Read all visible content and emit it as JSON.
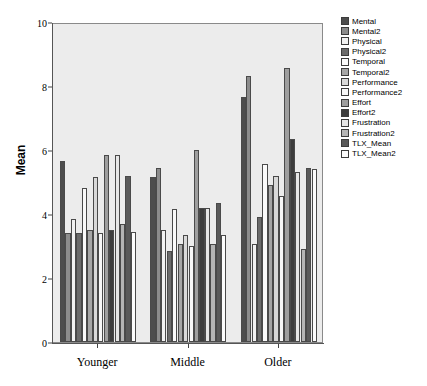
{
  "chart_data": {
    "type": "bar",
    "title": "",
    "xlabel": "",
    "ylabel": "Mean",
    "ylim": [
      0,
      10
    ],
    "yticks": [
      0,
      2,
      4,
      6,
      8,
      10
    ],
    "grid": false,
    "legend_position": "right",
    "categories": [
      "Younger",
      "Middle",
      "Older"
    ],
    "series": [
      {
        "name": "Mental",
        "color": "#4d4d4d",
        "values": [
          5.65,
          5.15,
          7.65
        ]
      },
      {
        "name": "Mental2",
        "color": "#8c8c8c",
        "values": [
          3.4,
          5.45,
          8.3
        ]
      },
      {
        "name": "Physical",
        "color": "#f2f2f2",
        "values": [
          3.85,
          3.5,
          3.05
        ]
      },
      {
        "name": "Physical2",
        "color": "#6b6b6b",
        "values": [
          3.4,
          2.85,
          3.9
        ]
      },
      {
        "name": "Temporal",
        "color": "#fafafa",
        "values": [
          4.8,
          4.15,
          5.55
        ]
      },
      {
        "name": "Temporal2",
        "color": "#a6a6a6",
        "values": [
          3.5,
          3.05,
          4.9
        ]
      },
      {
        "name": "Performance",
        "color": "#d9d9d9",
        "values": [
          5.15,
          3.35,
          5.2
        ]
      },
      {
        "name": "Performance2",
        "color": "#f7f7f7",
        "values": [
          3.4,
          3.0,
          4.55
        ]
      },
      {
        "name": "Effort",
        "color": "#9e9e9e",
        "values": [
          5.85,
          6.0,
          8.55
        ]
      },
      {
        "name": "Effort2",
        "color": "#3d3d3d",
        "values": [
          3.5,
          4.2,
          6.35
        ]
      },
      {
        "name": "Frustration",
        "color": "#e6e6e6",
        "values": [
          5.85,
          4.2,
          5.3
        ]
      },
      {
        "name": "Frustration2",
        "color": "#b5b5b5",
        "values": [
          3.7,
          3.05,
          2.9
        ]
      },
      {
        "name": "TLX_Mean",
        "color": "#5a5a5a",
        "values": [
          5.2,
          4.35,
          5.45
        ]
      },
      {
        "name": "TLX_Mean2",
        "color": "#fcfcfc",
        "values": [
          3.45,
          3.35,
          5.4
        ]
      }
    ]
  },
  "axis": {
    "y_title": "Mean",
    "y_tick_labels": [
      "0",
      "2",
      "4",
      "6",
      "8",
      "10"
    ],
    "x_tick_labels": [
      "Younger",
      "Middle",
      "Older"
    ]
  }
}
